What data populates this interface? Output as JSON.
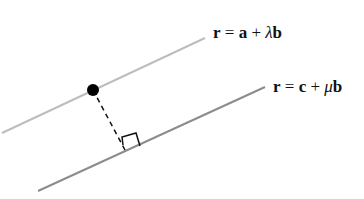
{
  "diagram": {
    "line1": {
      "label_r": "r",
      "label_eq": " = ",
      "label_pos": "a",
      "label_plus": " + ",
      "label_param": "λ",
      "label_dir": "b",
      "full": "r = a + λb",
      "color": "#bdbdbd",
      "from": [
        2,
        133
      ],
      "to": [
        205,
        38
      ]
    },
    "line2": {
      "label_r": "r",
      "label_eq": " = ",
      "label_pos": "c",
      "label_plus": " + ",
      "label_param": "μ",
      "label_dir": "b",
      "full": "r = c + μb",
      "color": "#8c8c8c",
      "from": [
        38,
        191
      ],
      "to": [
        265,
        87
      ]
    },
    "point": {
      "x": 93,
      "y": 90,
      "color": "#000000"
    },
    "perpendicular": {
      "foot": [
        128,
        151
      ],
      "style": "dashed"
    }
  }
}
